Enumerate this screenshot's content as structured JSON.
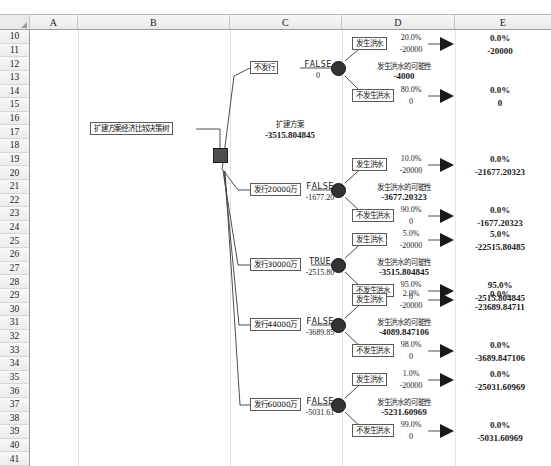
{
  "app": {
    "type": "spreadsheet-decision-tree",
    "columns": [
      "A",
      "B",
      "C",
      "D",
      "E"
    ],
    "rows": [
      "10",
      "11",
      "12",
      "13",
      "14",
      "15",
      "16",
      "17",
      "18",
      "19",
      "20",
      "21",
      "22",
      "23",
      "24",
      "25",
      "26",
      "27",
      "28",
      "29",
      "30",
      "31",
      "32",
      "33",
      "34",
      "35",
      "36",
      "37",
      "38",
      "39",
      "40",
      "41"
    ],
    "corner_icon": "select-all-triangle-icon"
  },
  "tree": {
    "title_box": "扩建方案经济比较决策树",
    "root_label": "扩建方案",
    "root_value": "-3515.804845",
    "branches": [
      {
        "option_label": "不发行",
        "decision_flag": "FALSE",
        "decision_value": "0",
        "chance_label": "发生洪水的可能性",
        "chance_value": "-4000",
        "outcomes": [
          {
            "label": "发生洪水",
            "prob": "20.0%",
            "payoff": "-20000",
            "end_prob": "0.0%",
            "end_value": "-20000"
          },
          {
            "label": "不发生洪水",
            "prob": "80.0%",
            "payoff": "0",
            "end_prob": "0.0%",
            "end_value": "0"
          }
        ]
      },
      {
        "option_label": "发行20000万",
        "decision_flag": "FALSE",
        "decision_value": "-1677.20",
        "chance_label": "发生洪水的可能性",
        "chance_value": "-3677.20323",
        "outcomes": [
          {
            "label": "发生洪水",
            "prob": "10.0%",
            "payoff": "-20000",
            "end_prob": "0.0%",
            "end_value": "-21677.20323"
          },
          {
            "label": "不发生洪水",
            "prob": "90.0%",
            "payoff": "0",
            "end_prob": "0.0%",
            "end_value": "-1677.20323"
          }
        ]
      },
      {
        "option_label": "发行30000万",
        "decision_flag": "TRUE",
        "decision_value": "-2515.80",
        "chance_label": "发生洪水的可能性",
        "chance_value": "-3515.804845",
        "outcomes": [
          {
            "label": "发生洪水",
            "prob": "5.0%",
            "payoff": "-20000",
            "end_prob": "5.0%",
            "end_value": "-22515.80485"
          },
          {
            "label": "不发生洪水",
            "prob": "95.0%",
            "payoff": "0",
            "end_prob": "95.0%",
            "end_value": "-2515.804845"
          }
        ]
      },
      {
        "option_label": "发行44000万",
        "decision_flag": "FALSE",
        "decision_value": "-3689.85",
        "chance_label": "发生洪水的可能性",
        "chance_value": "-4089.847106",
        "outcomes": [
          {
            "label": "发生洪水",
            "prob": "2.0%",
            "payoff": "-20000",
            "end_prob": "0.0%",
            "end_value": "-23689.84711"
          },
          {
            "label": "不发生洪水",
            "prob": "98.0%",
            "payoff": "0",
            "end_prob": "0.0%",
            "end_value": "-3689.847106"
          }
        ]
      },
      {
        "option_label": "发行60000万",
        "decision_flag": "FALSE",
        "decision_value": "-5031.61",
        "chance_label": "发生洪水的可能性",
        "chance_value": "-5231.60969",
        "outcomes": [
          {
            "label": "发生洪水",
            "prob": "1.0%",
            "payoff": "-20000",
            "end_prob": "0.0%",
            "end_value": "-25031.60969"
          },
          {
            "label": "不发生洪水",
            "prob": "99.0%",
            "payoff": "0",
            "end_prob": "0.0%",
            "end_value": "-5031.60969"
          }
        ]
      }
    ]
  },
  "colors": {
    "node_fill": "#333333",
    "grid": "#e4e4e4",
    "header_bg": "#f1f1f1"
  }
}
